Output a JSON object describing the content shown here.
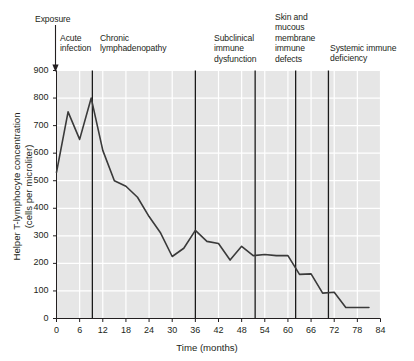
{
  "chart_data": {
    "type": "line",
    "title": "",
    "xlabel": "Time (months)",
    "ylabel": "Helper T-lymphocyte concentration\n(cells per microliter)",
    "xlim": [
      0,
      84
    ],
    "ylim": [
      0,
      900
    ],
    "xticks": [
      0,
      6,
      12,
      18,
      24,
      30,
      36,
      42,
      48,
      54,
      60,
      66,
      72,
      78,
      84
    ],
    "yticks": [
      0,
      100,
      200,
      300,
      400,
      500,
      600,
      700,
      800,
      900
    ],
    "grid": true,
    "legend": "none",
    "series": [
      {
        "name": "Helper T-lymphocyte concentration",
        "color": "#3a3a3a",
        "x": [
          0,
          3,
          6,
          9,
          12,
          15,
          18,
          21,
          24,
          27,
          30,
          33,
          36,
          39,
          42,
          45,
          48,
          51,
          54,
          57,
          60,
          63,
          66,
          69,
          72,
          75,
          78,
          81
        ],
        "values": [
          530,
          750,
          650,
          800,
          610,
          500,
          480,
          440,
          370,
          310,
          225,
          255,
          320,
          280,
          272,
          212,
          262,
          228,
          232,
          228,
          228,
          160,
          162,
          92,
          95,
          40,
          40,
          40
        ]
      }
    ],
    "annotation_lines": [
      {
        "label": "acute-infection",
        "x": 9.3
      },
      {
        "label": "chronic-lymphadenopathy",
        "x": 36
      },
      {
        "label": "subclinical-immune-dysfunction",
        "x": 51.5
      },
      {
        "label": "skin-and-mucous-membrane-immune-defects",
        "x": 62
      },
      {
        "label": "systemic-immune-deficiency",
        "x": 70.5
      }
    ],
    "annotations": [
      {
        "name": "exposure",
        "text": "Exposure",
        "arrow": true
      },
      {
        "name": "acute",
        "text": "Acute\ninfection",
        "arrow": false
      },
      {
        "name": "chronic",
        "text": "Chronic\nlymphadenopathy",
        "arrow": false
      },
      {
        "name": "subclin",
        "text": "Subclinical\nimmune\ndysfunction",
        "arrow": false
      },
      {
        "name": "skin",
        "text": "Skin and\nmucous\nmembrane\nimmune\ndefects",
        "arrow": false
      },
      {
        "name": "systemic",
        "text": "Systemic immune\ndeficiency",
        "arrow": false
      }
    ],
    "style": {
      "plot_background": "#e6e6e6",
      "gridline_color": "#ffffff",
      "line_color": "#3a3a3a",
      "annotation_line_color": "#1a1a1a",
      "text_color": "#231f20"
    }
  }
}
